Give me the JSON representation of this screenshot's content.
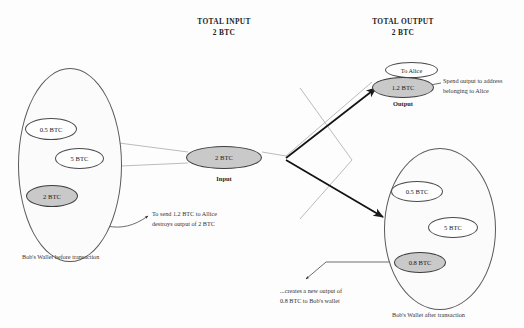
{
  "page": {
    "clipped_title": "",
    "bg_color": "#fdfdfd",
    "shade_color": "#c9c9c9",
    "stroke_color": "#4a4a4a"
  },
  "headers": {
    "input": {
      "line1": "TOTAL INPUT",
      "line2": "2 BTC"
    },
    "output": {
      "line1": "TOTAL OUTPUT",
      "line2": "2 BTC"
    }
  },
  "wallet_before": {
    "caption": "Bob's Wallet before transaction",
    "coins": [
      {
        "label": "0.5 BTC",
        "shaded": false
      },
      {
        "label": "5 BTC",
        "shaded": false
      },
      {
        "label": "2 BTC",
        "shaded": true
      }
    ]
  },
  "wallet_after": {
    "caption": "Bob's Wallet after transaction",
    "coins": [
      {
        "label": "0.5 BTC",
        "shaded": false
      },
      {
        "label": "5 BTC",
        "shaded": false
      },
      {
        "label": "0.8 BTC",
        "shaded": true
      }
    ]
  },
  "input_node": {
    "amount": "2 BTC",
    "label": "Input"
  },
  "output_node": {
    "amount": "1.2 BTC",
    "label": "Output",
    "bubble": "To Alice"
  },
  "notes": {
    "spend": {
      "line1": "To send 1.2 BTC to Allice",
      "line2": "destroys output of 2 BTC"
    },
    "alice": {
      "line1": "Spend output to address",
      "line2": "belonging to Alice"
    },
    "change": {
      "line1": "...creates a new output of",
      "line2": "0.8 BTC to Bob's wallet"
    }
  }
}
